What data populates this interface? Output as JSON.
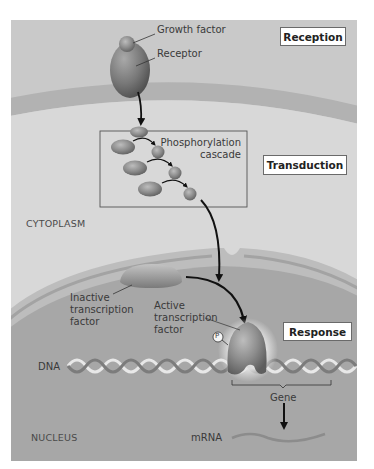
{
  "figure": {
    "colors": {
      "background": "#ffffff",
      "extracellular": "#c9c9c9",
      "membrane": "#b4b4b4",
      "cytoplasm": "#d9d9d9",
      "nuclear_envelope": "#b9b9b9",
      "nucleoplasm": "#a6a6a6",
      "protein": "#8a8a8a",
      "arrow": "#111111",
      "stage_box_border": "#6a6a6a"
    }
  },
  "stages": {
    "reception": "Reception",
    "transduction": "Transduction",
    "response": "Response"
  },
  "regions": {
    "cytoplasm": "CYTOPLASM",
    "nucleus": "NUCLEUS"
  },
  "labels": {
    "growth_factor": "Growth factor",
    "receptor": "Receptor",
    "cascade_line1": "Phosphorylation",
    "cascade_line2": "cascade",
    "inactive_line1": "Inactive",
    "inactive_line2": "transcription",
    "inactive_line3": "factor",
    "active_line1": "Active",
    "active_line2": "transcription",
    "active_line3": "factor",
    "phosphate": "P",
    "dna": "DNA",
    "gene": "Gene",
    "mrna": "mRNA"
  }
}
